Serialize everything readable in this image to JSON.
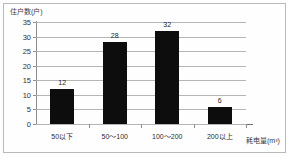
{
  "chart_data": {
    "type": "bar",
    "title": "",
    "subtitle": "",
    "categories": [
      "50以下",
      "50～100",
      "100～200",
      "200以上"
    ],
    "values": [
      12,
      28,
      32,
      6
    ],
    "value_labels": [
      "12",
      "28",
      "32",
      "6"
    ],
    "xlabel": "耗电量(m³)",
    "ylabel": "住户数(户)",
    "ylim": [
      0,
      35
    ],
    "ytick_labels": [
      "0",
      "5",
      "10",
      "15",
      "20",
      "25",
      "30",
      "35"
    ],
    "ytick_values": [
      0,
      5,
      10,
      15,
      20,
      25,
      30,
      35
    ],
    "grid": "horizontal",
    "legend": "none",
    "bar_color": "#0d0d0d",
    "grid_color": "#b5b5b5",
    "axis_color": "#8d8d8d",
    "series": [
      {
        "name": "住户数",
        "values": [
          12,
          28,
          32,
          6
        ]
      }
    ]
  }
}
